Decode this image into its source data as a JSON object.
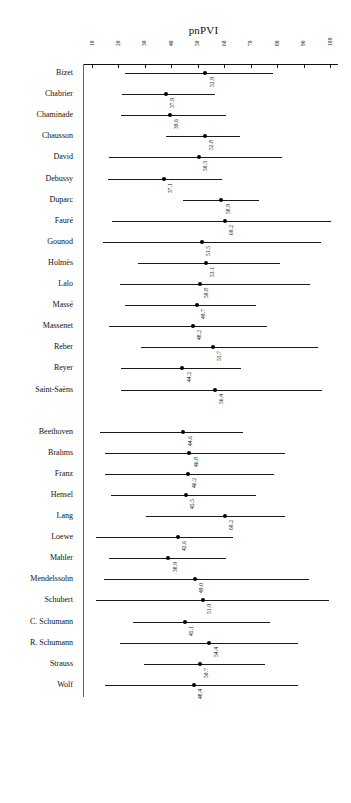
{
  "chart_data": {
    "type": "scatter",
    "title": "pnPVI",
    "xlabel": "",
    "ylabel": "",
    "xlim": [
      10,
      100
    ],
    "ticks": [
      10,
      20,
      30,
      40,
      50,
      60,
      70,
      80,
      90,
      100
    ],
    "tick_labels": [
      "10",
      "20",
      "30",
      "40",
      "50",
      "60",
      "70",
      "80",
      "90",
      "100"
    ],
    "grid": false,
    "legend": "none",
    "orientation": "horizontal",
    "error_bar_style": "confidence-interval-with-point-estimate",
    "groups": [
      {
        "name": "group-1",
        "rows": [
          {
            "label": "Bizet",
            "value": 52.9,
            "low": 22.5,
            "high": 78.5
          },
          {
            "label": "Chabrier",
            "value": 37.9,
            "low": 21.5,
            "high": 56.5
          },
          {
            "label": "Chaminade",
            "value": 39.6,
            "low": 21.0,
            "high": 60.5
          },
          {
            "label": "Chausson",
            "value": 52.8,
            "low": 38.0,
            "high": 66.0
          },
          {
            "label": "David",
            "value": 50.3,
            "low": 16.5,
            "high": 82.0
          },
          {
            "label": "Debussy",
            "value": 37.1,
            "low": 16.0,
            "high": 59.0
          },
          {
            "label": "Duparc",
            "value": 58.9,
            "low": 44.5,
            "high": 73.0
          },
          {
            "label": "Fauré",
            "value": 60.2,
            "low": 17.5,
            "high": 100.5
          },
          {
            "label": "Gounod",
            "value": 51.5,
            "low": 14.0,
            "high": 96.5
          },
          {
            "label": "Holmès",
            "value": 53.1,
            "low": 27.5,
            "high": 81.0
          },
          {
            "label": "Lalo",
            "value": 50.8,
            "low": 20.5,
            "high": 92.5
          },
          {
            "label": "Massé",
            "value": 49.7,
            "low": 22.5,
            "high": 72.0
          },
          {
            "label": "Massenet",
            "value": 48.2,
            "low": 16.5,
            "high": 76.0
          },
          {
            "label": "Reber",
            "value": 55.7,
            "low": 28.5,
            "high": 95.5
          },
          {
            "label": "Reyer",
            "value": 44.2,
            "low": 21.0,
            "high": 66.5
          },
          {
            "label": "Saint-Saëns",
            "value": 56.4,
            "low": 21.0,
            "high": 97.0
          }
        ]
      },
      {
        "name": "group-2",
        "rows": [
          {
            "label": "Beethoven",
            "value": 44.6,
            "low": 13.0,
            "high": 67.0
          },
          {
            "label": "Brahms",
            "value": 46.8,
            "low": 15.0,
            "high": 83.0
          },
          {
            "label": "Franz",
            "value": 46.2,
            "low": 15.0,
            "high": 79.0
          },
          {
            "label": "Hensel",
            "value": 45.5,
            "low": 17.0,
            "high": 72.0
          },
          {
            "label": "Lang",
            "value": 60.2,
            "low": 30.5,
            "high": 83.0
          },
          {
            "label": "Loewe",
            "value": 42.6,
            "low": 11.5,
            "high": 63.5
          },
          {
            "label": "Mahler",
            "value": 38.9,
            "low": 16.5,
            "high": 60.5
          },
          {
            "label": "Mendelssohn",
            "value": 49.0,
            "low": 14.5,
            "high": 92.0
          },
          {
            "label": "Schubert",
            "value": 51.9,
            "low": 11.5,
            "high": 99.5
          },
          {
            "label": "C. Schumann",
            "value": 45.1,
            "low": 25.5,
            "high": 77.5
          },
          {
            "label": "R. Schumann",
            "value": 54.4,
            "low": 20.5,
            "high": 88.0
          },
          {
            "label": "Strauss",
            "value": 50.7,
            "low": 29.5,
            "high": 75.5
          },
          {
            "label": "Wolf",
            "value": 48.4,
            "low": 15.0,
            "high": 88.0
          }
        ]
      }
    ]
  }
}
